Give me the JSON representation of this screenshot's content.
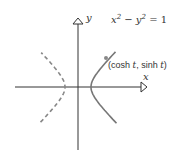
{
  "diagram": {
    "type": "hyperbola-plot",
    "equation_label": {
      "lhs_x": "x",
      "exp_x": "2",
      "minus": " − ",
      "lhs_y": "y",
      "exp_y": "2",
      "rhs": " = 1"
    },
    "point_label": {
      "open": "(cosh ",
      "t1": "t",
      "sep": ", sinh ",
      "t2": "t",
      "close": ")"
    },
    "x_axis_label": "x",
    "y_axis_label": "y",
    "colors": {
      "axis": "#333333",
      "curve": "#777777",
      "point": "#888888",
      "text": "#333333"
    },
    "branches": [
      {
        "name": "right-branch",
        "style": "solid"
      },
      {
        "name": "left-branch",
        "style": "dashed"
      }
    ],
    "origin_px": [
      78,
      87
    ],
    "unit_px": 13,
    "marked_point_t": 1.4
  }
}
